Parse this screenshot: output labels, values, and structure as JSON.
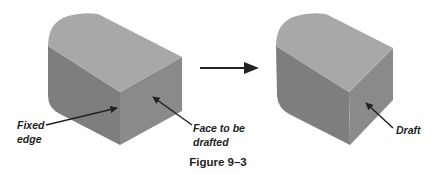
{
  "figure": {
    "caption": "Figure 9–3",
    "colors": {
      "top_face": "#a9a9a9",
      "side_face": "#828282",
      "front_face": "#8c8c8c",
      "arrow": "#222222"
    },
    "left_part": {
      "labels": {
        "fixed_edge_line1": "Fixed",
        "fixed_edge_line2": "edge",
        "face_line1": "Face to be",
        "face_line2": "drafted"
      }
    },
    "transition_arrow": "arrow-right-icon",
    "right_part": {
      "labels": {
        "draft": "Draft"
      }
    }
  }
}
